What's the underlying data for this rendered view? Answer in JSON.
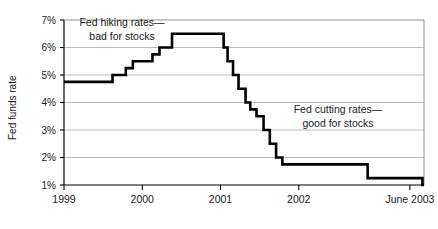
{
  "chart_data": {
    "type": "line",
    "title": "",
    "xlabel": "",
    "ylabel": "Fed funds rate",
    "ylim": [
      1,
      7
    ],
    "xlim": [
      1999.0,
      2003.6
    ],
    "grid": true,
    "legend": "none",
    "line_style": "step-post",
    "y_ticks": [
      "1%",
      "2%",
      "3%",
      "4%",
      "5%",
      "6%",
      "7%"
    ],
    "y_tick_values": [
      1,
      2,
      3,
      4,
      5,
      6,
      7
    ],
    "x_ticks": [
      "1999",
      "2000",
      "2001",
      "2002",
      "June 2003"
    ],
    "x_tick_values": [
      1999.0,
      2000.0,
      2001.0,
      2002.0,
      2003.42
    ],
    "series": [
      {
        "name": "Fed funds rate",
        "x": [
          1999.0,
          1999.48,
          1999.62,
          1999.79,
          1999.88,
          2000.04,
          2000.13,
          2000.22,
          2000.38,
          2001.0,
          2001.04,
          2001.09,
          2001.16,
          2001.23,
          2001.32,
          2001.38,
          2001.46,
          2001.55,
          2001.63,
          2001.71,
          2001.79,
          2001.88,
          2002.88,
          2003.52,
          2003.58
        ],
        "y": [
          4.75,
          4.75,
          5.0,
          5.25,
          5.5,
          5.5,
          5.75,
          6.0,
          6.5,
          6.5,
          6.0,
          5.5,
          5.0,
          4.5,
          4.0,
          3.75,
          3.5,
          3.0,
          2.5,
          2.0,
          1.75,
          1.75,
          1.25,
          1.25,
          1.0
        ],
        "color": "#000000"
      }
    ],
    "annotations": [
      {
        "name": "fed-hiking-annotation",
        "lines": [
          "Fed hiking rates—",
          "bad for stocks"
        ],
        "x_px": 122,
        "y_px": 26,
        "align": "center"
      },
      {
        "name": "fed-cutting-annotation",
        "lines": [
          "Fed cutting rates—",
          "good for stocks"
        ],
        "x_px": 338,
        "y_px": 113,
        "align": "center"
      }
    ]
  },
  "colors": {
    "line": "#000000",
    "gridline": "#b4b4b4",
    "axis": "#000000",
    "text": "#1a1a1a",
    "background": "#ffffff"
  }
}
